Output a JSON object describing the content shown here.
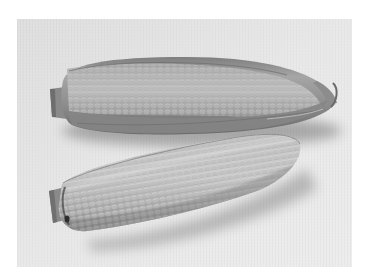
{
  "image": {
    "description": "Grayscale photo of two ears of sweet corn lying diagonally on a light textured background",
    "alt": "Two ears of corn",
    "border_color": "#ffffff",
    "background_color": "#e6e6e6",
    "subjects": [
      {
        "name": "top-corn-cob",
        "state": "partially husked",
        "tone": "#9a9a9a"
      },
      {
        "name": "bottom-corn-cob",
        "state": "husked",
        "tone": "#b4b4b4"
      }
    ]
  }
}
